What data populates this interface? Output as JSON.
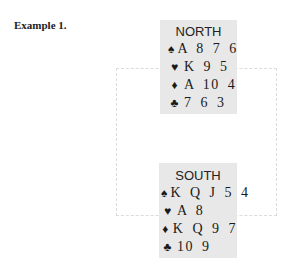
{
  "title": "Example 1.",
  "hands": {
    "north": {
      "seat": "NORTH",
      "suits": [
        {
          "icon": "♠",
          "name": "spades",
          "cards": "A 8  7 6"
        },
        {
          "icon": "♥",
          "name": "hearts",
          "cards": "K 9  5"
        },
        {
          "icon": "♦",
          "name": "diamonds",
          "cards": "A 10 4"
        },
        {
          "icon": "♣",
          "name": "clubs",
          "cards": "7  6  3"
        }
      ]
    },
    "south": {
      "seat": "SOUTH",
      "suits": [
        {
          "icon": "♠",
          "name": "spades",
          "cards": "K Q J 5 4"
        },
        {
          "icon": "♥",
          "name": "hearts",
          "cards": "A  8"
        },
        {
          "icon": "♦",
          "name": "diamonds",
          "cards": "K Q 9 7"
        },
        {
          "icon": "♣",
          "name": "clubs",
          "cards": "10 9"
        }
      ]
    }
  },
  "colors": {
    "hand_background": "#e8e8e8",
    "table_outline": "#dcdcdc"
  }
}
